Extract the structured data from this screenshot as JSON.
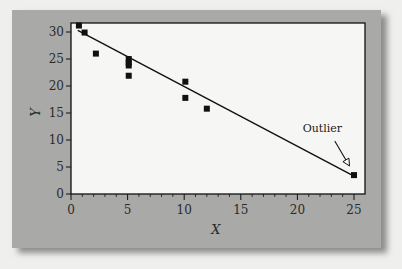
{
  "chart_data": {
    "type": "scatter",
    "title": "",
    "xlabel": "X",
    "ylabel": "Y",
    "xlim": [
      0,
      26
    ],
    "ylim": [
      0,
      32
    ],
    "x_ticks": [
      0,
      5,
      10,
      15,
      20,
      25
    ],
    "y_ticks": [
      0,
      5,
      10,
      15,
      20,
      25,
      30
    ],
    "x_minor_step": 1,
    "grid": false,
    "legend": null,
    "series": [
      {
        "name": "data",
        "marker": "square",
        "points": [
          {
            "x": 0.7,
            "y": 31.2
          },
          {
            "x": 1.2,
            "y": 29.9
          },
          {
            "x": 2.2,
            "y": 26.0
          },
          {
            "x": 5.1,
            "y": 25.0
          },
          {
            "x": 5.1,
            "y": 24.3
          },
          {
            "x": 5.1,
            "y": 23.8
          },
          {
            "x": 5.1,
            "y": 21.9
          },
          {
            "x": 10.1,
            "y": 20.8
          },
          {
            "x": 10.1,
            "y": 17.8
          },
          {
            "x": 12.0,
            "y": 15.8
          },
          {
            "x": 25.0,
            "y": 3.5
          }
        ]
      }
    ],
    "fit_line": {
      "type": "linear",
      "x0": 0.6,
      "y0": 30.3,
      "x1": 25.0,
      "y1": 3.3
    },
    "annotations": [
      {
        "text": "Outlier",
        "text_x": 22.2,
        "text_y": 11.5,
        "arrow_from": {
          "x": 23.3,
          "y": 9.8
        },
        "arrow_to": {
          "x": 24.6,
          "y": 5.2
        }
      }
    ]
  },
  "colors": {
    "panel": "#a9a9a7",
    "plot_bg": "#f6f6f4",
    "ink": "#111111",
    "page": "#efefed"
  }
}
